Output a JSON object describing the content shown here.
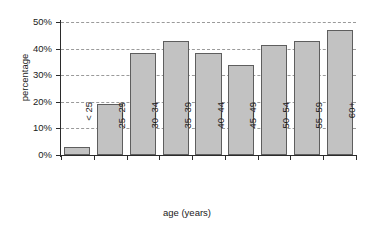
{
  "chart_data": {
    "type": "bar",
    "title": "",
    "xlabel": "age (years)",
    "ylabel": "percentage",
    "categories": [
      "< 25",
      "25–29",
      "30–34",
      "35–39",
      "40–44",
      "45–49",
      "50–54",
      "55–59",
      "60+"
    ],
    "values": [
      3,
      19,
      38.5,
      43,
      38.5,
      34,
      41.5,
      43,
      47
    ],
    "ylim": [
      0,
      50
    ],
    "ytick_values": [
      0,
      10,
      20,
      30,
      40,
      50
    ],
    "ytick_labels": [
      "0%",
      "10%",
      "20%",
      "30%",
      "40%",
      "50%"
    ],
    "grid": true,
    "grid_axis": "y",
    "grid_style": "dashed",
    "legend": false,
    "bar_fill_color": "#c2c2c2",
    "bar_edge_color": "#5e5e5e",
    "axis_color": "#2b2b2b",
    "grid_color": "#9a9a9a",
    "background_color": "#ffffff",
    "xtick_label_rotation": 90
  }
}
